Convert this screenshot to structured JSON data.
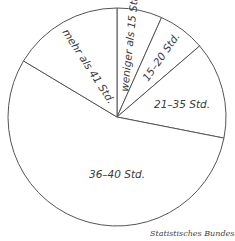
{
  "chart_data": {
    "type": "pie",
    "title": "",
    "start_angle_deg": 0,
    "direction": "clockwise",
    "categories": [
      "weniger als 15 Std.",
      "15–20 Std.",
      "21–35 Std.",
      "36–40 Std.",
      "mehr als 41 Std."
    ],
    "values": [
      6.7,
      7.0,
      14.4,
      55.5,
      16.4
    ],
    "unit": "%",
    "colors": [
      "#ffffff",
      "#ffffff",
      "#ffffff",
      "#ffffff",
      "#ffffff"
    ],
    "stroke": "#555555",
    "legend": "none (labels inside slices)"
  },
  "labels": {
    "s0": "weniger als 15 Std.",
    "s1": "15–20 Std.",
    "s2": "21–35 Std.",
    "s3": "36–40 Std.",
    "s4": "mehr als 41 Std."
  },
  "source": "Statistisches Bundesamt"
}
